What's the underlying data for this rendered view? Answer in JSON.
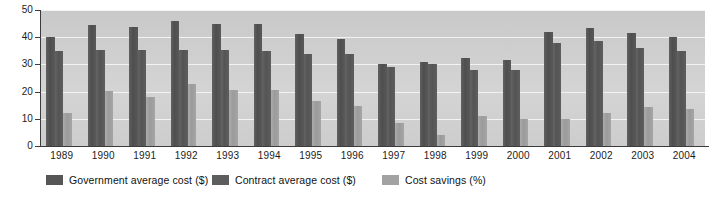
{
  "chart_data": {
    "type": "bar",
    "title": "",
    "subtitle": "",
    "xlabel": "",
    "ylabel": "",
    "ylim": [
      0,
      50
    ],
    "yticks": [
      0,
      10,
      20,
      30,
      40,
      50
    ],
    "grid": true,
    "legend_position": "bottom",
    "categories": [
      "1989",
      "1990",
      "1991",
      "1992",
      "1993",
      "1994",
      "1995",
      "1996",
      "1997",
      "1998",
      "1999",
      "2000",
      "2001",
      "2002",
      "2003",
      "2004"
    ],
    "series": [
      {
        "name": "Government average cost ($)",
        "color": "#565656",
        "values": [
          40.2,
          44.5,
          43.7,
          46.0,
          45.0,
          44.8,
          41.0,
          39.5,
          30.3,
          31.0,
          32.5,
          31.5,
          42.0,
          43.5,
          41.5,
          40.0
        ]
      },
      {
        "name": "Contract average cost ($)",
        "color": "#5d5d5d",
        "values": [
          34.8,
          35.3,
          35.3,
          35.3,
          35.2,
          34.9,
          34.0,
          34.0,
          29.2,
          30.0,
          28.0,
          28.0,
          38.0,
          38.5,
          36.0,
          34.8
        ]
      },
      {
        "name": "Cost savings (%)",
        "color": "#a2a2a2",
        "values": [
          12.2,
          20.2,
          18.2,
          22.7,
          20.5,
          20.5,
          16.5,
          14.7,
          8.5,
          4.0,
          11.0,
          9.8,
          9.8,
          12.2,
          14.2,
          13.5
        ]
      }
    ]
  },
  "axis": {
    "y_tick_labels": [
      "50",
      "40",
      "30",
      "20",
      "10",
      "0"
    ]
  },
  "legend": {
    "items": [
      {
        "label": "Government average cost ($)",
        "series": 0
      },
      {
        "label": "Contract average cost ($)",
        "series": 1
      },
      {
        "label": "Cost savings (%)",
        "series": 2
      }
    ]
  },
  "colors": {
    "plot_background": "#cfcfcf",
    "gridline": "#f2f2f2",
    "axis": "#3b3b3b",
    "text": "#1c1c1c",
    "page_background": "#ffffff"
  }
}
